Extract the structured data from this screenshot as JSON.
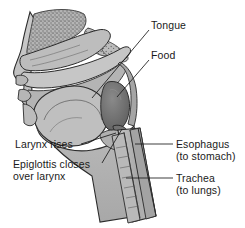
{
  "figure": {
    "width": 245,
    "height": 228,
    "background": "#ffffff"
  },
  "colors": {
    "outline": "#2b2b2b",
    "tissue_light": "#c9c9c9",
    "tissue_mid": "#b0b0b0",
    "tissue_dark": "#9a9a9a",
    "cavity": "#b8b8b8",
    "food_bolus": "#6e6e6e",
    "bone_stipple": "#8a8a8a",
    "label_text": "#1a1a1a",
    "leader_line": "#1a1a1a"
  },
  "labels": [
    {
      "id": "tongue",
      "name": "tongue",
      "text": "Tongue",
      "sub": "",
      "x": 151,
      "y": 20,
      "leader": {
        "x1": 149,
        "y1": 30,
        "x2": 92,
        "y2": 98
      }
    },
    {
      "id": "food",
      "name": "food",
      "text": "Food",
      "sub": "",
      "x": 151,
      "y": 50,
      "leader": {
        "x1": 149,
        "y1": 60,
        "x2": 117,
        "y2": 97
      }
    },
    {
      "id": "larynx",
      "name": "larynx-rises",
      "text": "Larynx rises",
      "sub": "",
      "x": 15,
      "y": 139,
      "leader": {
        "x1": 81,
        "y1": 144,
        "x2": 116,
        "y2": 133
      }
    },
    {
      "id": "epiglottis",
      "name": "epiglottis-closes-over-larynx",
      "text": "Epiglottis closes",
      "sub": "over larynx",
      "x": 13,
      "y": 159,
      "leader": {
        "x1": 102,
        "y1": 163,
        "x2": 122,
        "y2": 129
      }
    },
    {
      "id": "esophagus",
      "name": "esophagus",
      "text": "Esophagus",
      "sub": "(to stomach)",
      "x": 176,
      "y": 139,
      "leader": {
        "x1": 173,
        "y1": 144,
        "x2": 135,
        "y2": 144
      }
    },
    {
      "id": "trachea",
      "name": "trachea",
      "text": "Trachea",
      "sub": "(to lungs)",
      "x": 176,
      "y": 173,
      "leader": {
        "x1": 173,
        "y1": 178,
        "x2": 126,
        "y2": 178
      }
    }
  ],
  "structures": [
    {
      "name": "nasal-cavity",
      "label": "Nasal cavity"
    },
    {
      "name": "hard-palate",
      "label": "Hard palate"
    },
    {
      "name": "soft-palate",
      "label": "Soft palate"
    },
    {
      "name": "oral-cavity",
      "label": "Oral cavity"
    },
    {
      "name": "tongue-body",
      "label": "Tongue"
    },
    {
      "name": "food-bolus",
      "label": "Food bolus"
    },
    {
      "name": "pharynx",
      "label": "Pharynx"
    },
    {
      "name": "epiglottis-flap",
      "label": "Epiglottis"
    },
    {
      "name": "larynx-body",
      "label": "Larynx"
    },
    {
      "name": "esophagus-tube",
      "label": "Esophagus"
    },
    {
      "name": "trachea-tube",
      "label": "Trachea"
    },
    {
      "name": "lips",
      "label": "Lips"
    },
    {
      "name": "chin",
      "label": "Chin"
    },
    {
      "name": "spinal-column",
      "label": "Spinal column"
    }
  ]
}
